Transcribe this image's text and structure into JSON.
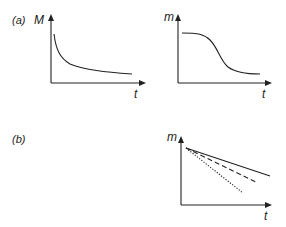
{
  "figure": {
    "panels": [
      {
        "id": "a",
        "label": "(a)",
        "plots": [
          {
            "id": "a-left",
            "y_label": "M",
            "x_label": "t",
            "curve": "decaying, steep initial drop then levels off",
            "path": "M54,34 C56,50 60,58 70,64 C85,70 105,72 132,74"
          },
          {
            "id": "a-right",
            "y_label": "m",
            "x_label": "t",
            "curve": "sigmoid decrease from high plateau to low plateau",
            "path": "M182,33 C198,33 204,34 210,40 C218,48 220,60 228,67 C236,73 248,74 260,74"
          }
        ]
      },
      {
        "id": "b",
        "label": "(b)",
        "plots": [
          {
            "id": "b-main",
            "y_label": "m",
            "x_label": "t",
            "lines": [
              {
                "style": "solid",
                "x1": 186,
                "y1": 148,
                "x2": 270,
                "y2": 176
              },
              {
                "style": "dashed",
                "x1": 186,
                "y1": 148,
                "x2": 258,
                "y2": 183
              },
              {
                "style": "dotted",
                "x1": 186,
                "y1": 148,
                "x2": 243,
                "y2": 193
              }
            ]
          }
        ]
      }
    ]
  }
}
